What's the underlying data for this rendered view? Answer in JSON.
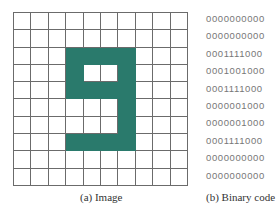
{
  "figure": {
    "image_caption": "(a) Image",
    "code_caption": "(b) Binary code",
    "fill_color": "#2a7a6c",
    "rows": [
      "0000000000",
      "0000000000",
      "0001111000",
      "0001001000",
      "0001111000",
      "0000001000",
      "0000001000",
      "0001111000",
      "0000000000",
      "0000000000"
    ]
  }
}
